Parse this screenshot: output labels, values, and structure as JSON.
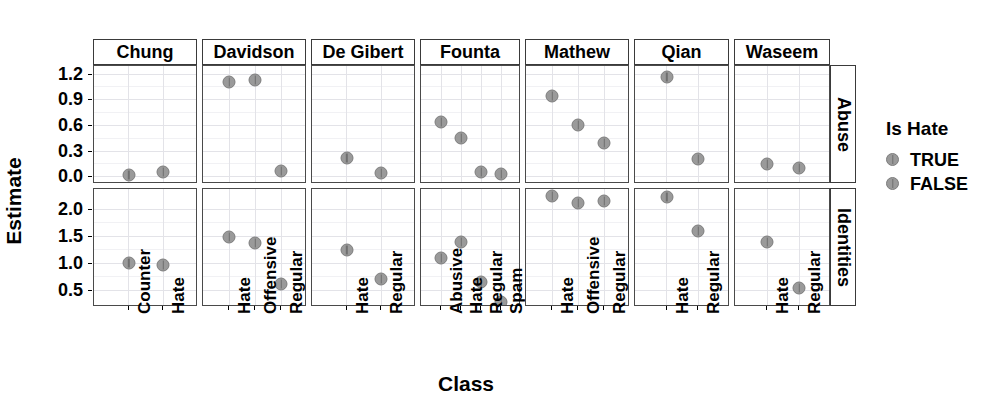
{
  "chart_data": {
    "type": "scatter",
    "title": "",
    "xlabel": "Class",
    "ylabel": "Estimate",
    "grid": true,
    "legend": {
      "title": "Is Hate",
      "position": "right",
      "entries": [
        {
          "label": "TRUE",
          "color": "#9a9a9a"
        },
        {
          "label": "FALSE",
          "color": "#9a9a9a"
        }
      ]
    },
    "facet_cols": [
      "Chung",
      "Davidson",
      "De Gibert",
      "Founta",
      "Mathew",
      "Qian",
      "Waseem"
    ],
    "facet_rows": [
      "Abuse",
      "Identities"
    ],
    "row_axes": [
      {
        "row": "Abuse",
        "ticks": [
          0.0,
          0.3,
          0.6,
          0.9,
          1.2
        ],
        "tick_labels": [
          "0.0",
          "0.3",
          "0.6",
          "0.9",
          "1.2"
        ],
        "ylim": [
          -0.08,
          1.3
        ]
      },
      {
        "row": "Identities",
        "ticks": [
          0.5,
          1.0,
          1.5,
          2.0
        ],
        "tick_labels": [
          "0.5",
          "1.0",
          "1.5",
          "2.0"
        ],
        "ylim": [
          0.2,
          2.38
        ]
      }
    ],
    "panels": [
      {
        "dataset": "Chung",
        "row": "Abuse",
        "categories": [
          "Counter",
          "Hate"
        ],
        "points": [
          {
            "x": "Counter",
            "y": 0.02,
            "is_hate": "FALSE"
          },
          {
            "x": "Hate",
            "y": 0.06,
            "is_hate": "TRUE"
          }
        ]
      },
      {
        "dataset": "Chung",
        "row": "Identities",
        "categories": [
          "Counter",
          "Hate"
        ],
        "points": [
          {
            "x": "Counter",
            "y": 1.01,
            "is_hate": "FALSE"
          },
          {
            "x": "Hate",
            "y": 0.97,
            "is_hate": "TRUE"
          }
        ]
      },
      {
        "dataset": "Davidson",
        "row": "Abuse",
        "categories": [
          "Hate",
          "Offensive",
          "Regular"
        ],
        "points": [
          {
            "x": "Hate",
            "y": 1.11,
            "is_hate": "TRUE"
          },
          {
            "x": "Offensive",
            "y": 1.14,
            "is_hate": "FALSE"
          },
          {
            "x": "Regular",
            "y": 0.07,
            "is_hate": "FALSE"
          }
        ]
      },
      {
        "dataset": "Davidson",
        "row": "Identities",
        "categories": [
          "Hate",
          "Offensive",
          "Regular"
        ],
        "points": [
          {
            "x": "Hate",
            "y": 1.5,
            "is_hate": "TRUE"
          },
          {
            "x": "Offensive",
            "y": 1.38,
            "is_hate": "FALSE"
          },
          {
            "x": "Regular",
            "y": 0.63,
            "is_hate": "FALSE"
          }
        ]
      },
      {
        "dataset": "De Gibert",
        "row": "Abuse",
        "categories": [
          "Hate",
          "Regular"
        ],
        "points": [
          {
            "x": "Hate",
            "y": 0.22,
            "is_hate": "TRUE"
          },
          {
            "x": "Regular",
            "y": 0.05,
            "is_hate": "FALSE"
          }
        ]
      },
      {
        "dataset": "De Gibert",
        "row": "Identities",
        "categories": [
          "Hate",
          "Regular"
        ],
        "points": [
          {
            "x": "Hate",
            "y": 1.26,
            "is_hate": "TRUE"
          },
          {
            "x": "Regular",
            "y": 0.71,
            "is_hate": "FALSE"
          }
        ]
      },
      {
        "dataset": "Founta",
        "row": "Abuse",
        "categories": [
          "Abusive",
          "Hate",
          "Regular",
          "Spam"
        ],
        "points": [
          {
            "x": "Abusive",
            "y": 0.65,
            "is_hate": "FALSE"
          },
          {
            "x": "Hate",
            "y": 0.46,
            "is_hate": "TRUE"
          },
          {
            "x": "Regular",
            "y": 0.06,
            "is_hate": "FALSE"
          },
          {
            "x": "Spam",
            "y": 0.04,
            "is_hate": "FALSE"
          }
        ]
      },
      {
        "dataset": "Founta",
        "row": "Identities",
        "categories": [
          "Abusive",
          "Hate",
          "Regular",
          "Spam"
        ],
        "points": [
          {
            "x": "Abusive",
            "y": 1.1,
            "is_hate": "FALSE"
          },
          {
            "x": "Hate",
            "y": 1.4,
            "is_hate": "TRUE"
          },
          {
            "x": "Regular",
            "y": 0.67,
            "is_hate": "FALSE"
          },
          {
            "x": "Spam",
            "y": 0.3,
            "is_hate": "FALSE"
          }
        ]
      },
      {
        "dataset": "Mathew",
        "row": "Abuse",
        "categories": [
          "Hate",
          "Offensive",
          "Regular"
        ],
        "points": [
          {
            "x": "Hate",
            "y": 0.95,
            "is_hate": "TRUE"
          },
          {
            "x": "Offensive",
            "y": 0.61,
            "is_hate": "FALSE"
          },
          {
            "x": "Regular",
            "y": 0.4,
            "is_hate": "FALSE"
          }
        ]
      },
      {
        "dataset": "Mathew",
        "row": "Identities",
        "categories": [
          "Hate",
          "Offensive",
          "Regular"
        ],
        "points": [
          {
            "x": "Hate",
            "y": 2.25,
            "is_hate": "TRUE"
          },
          {
            "x": "Offensive",
            "y": 2.12,
            "is_hate": "FALSE"
          },
          {
            "x": "Regular",
            "y": 2.15,
            "is_hate": "FALSE"
          }
        ]
      },
      {
        "dataset": "Qian",
        "row": "Abuse",
        "categories": [
          "Hate",
          "Regular"
        ],
        "points": [
          {
            "x": "Hate",
            "y": 1.17,
            "is_hate": "TRUE"
          },
          {
            "x": "Regular",
            "y": 0.21,
            "is_hate": "FALSE"
          }
        ]
      },
      {
        "dataset": "Qian",
        "row": "Identities",
        "categories": [
          "Hate",
          "Regular"
        ],
        "points": [
          {
            "x": "Hate",
            "y": 2.24,
            "is_hate": "TRUE"
          },
          {
            "x": "Regular",
            "y": 1.61,
            "is_hate": "FALSE"
          }
        ]
      },
      {
        "dataset": "Waseem",
        "row": "Abuse",
        "categories": [
          "Hate",
          "Regular"
        ],
        "points": [
          {
            "x": "Hate",
            "y": 0.15,
            "is_hate": "TRUE"
          },
          {
            "x": "Regular",
            "y": 0.11,
            "is_hate": "FALSE"
          }
        ]
      },
      {
        "dataset": "Waseem",
        "row": "Identities",
        "categories": [
          "Hate",
          "Regular"
        ],
        "points": [
          {
            "x": "Hate",
            "y": 1.4,
            "is_hate": "TRUE"
          },
          {
            "x": "Regular",
            "y": 0.55,
            "is_hate": "FALSE"
          }
        ]
      }
    ]
  },
  "colors": {
    "point_fill": "#9a9a9a",
    "point_stroke": "#7d7d7d",
    "panel_border": "#4a4a4a",
    "grid_major": "#e3e3e8",
    "grid_minor": "#f1f1f4",
    "background": "#ffffff"
  }
}
